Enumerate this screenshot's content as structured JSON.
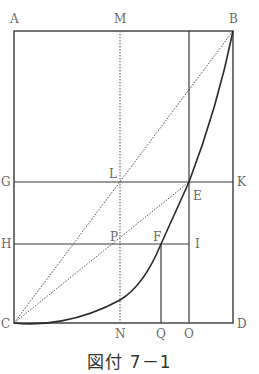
{
  "figure": {
    "caption": "図付 7－1",
    "points": {
      "A": "A",
      "M": "M",
      "B": "B",
      "G": "G",
      "L": "L",
      "K": "K",
      "E": "E",
      "H": "H",
      "P": "P",
      "F": "F",
      "I": "I",
      "C": "C",
      "N": "N",
      "Q": "Q",
      "O": "O",
      "D": "D"
    },
    "colors": {
      "line": "#3a3a3a",
      "label": "#6a6a6a"
    }
  }
}
